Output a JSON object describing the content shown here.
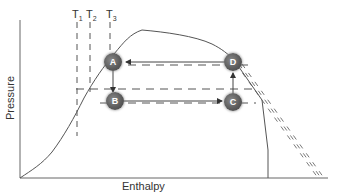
{
  "diagram": {
    "type": "pressure-enthalpy refrigeration cycle",
    "axes": {
      "x_label": "Enthalpy",
      "y_label": "Pressure"
    },
    "isotherms": [
      {
        "label": "T",
        "sub": "1"
      },
      {
        "label": "T",
        "sub": "2"
      },
      {
        "label": "T",
        "sub": "3"
      }
    ],
    "states": [
      {
        "id": "A",
        "label": "A"
      },
      {
        "id": "B",
        "label": "B"
      },
      {
        "id": "C",
        "label": "C"
      },
      {
        "id": "D",
        "label": "D"
      }
    ],
    "flow": [
      "D→A",
      "A→B",
      "B→C",
      "C→D"
    ],
    "colors": {
      "line": "#555555",
      "node": "#5c5c5c",
      "node_text": "#ffffff",
      "text": "#333333"
    }
  }
}
